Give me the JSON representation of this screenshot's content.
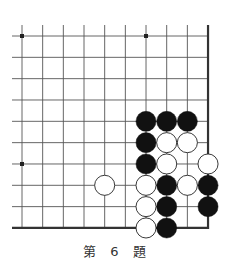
{
  "diagram": {
    "type": "go-problem",
    "caption": "第 6 題",
    "grid": {
      "columns": 10,
      "rows": 10,
      "origin_x": 22,
      "origin_y": 36,
      "step_x": 20.67,
      "step_y": 21.33,
      "open_left": true,
      "open_top": true,
      "closed_right": true,
      "closed_bottom": true
    },
    "star_points": [
      {
        "col": 0,
        "row": 0
      },
      {
        "col": 6,
        "row": 0
      },
      {
        "col": 0,
        "row": 6
      }
    ],
    "stones": [
      {
        "color": "black",
        "col": 6,
        "row": 4
      },
      {
        "color": "black",
        "col": 7,
        "row": 4
      },
      {
        "color": "black",
        "col": 8,
        "row": 4
      },
      {
        "color": "black",
        "col": 6,
        "row": 5
      },
      {
        "color": "white",
        "col": 7,
        "row": 5
      },
      {
        "color": "white",
        "col": 8,
        "row": 5
      },
      {
        "color": "black",
        "col": 6,
        "row": 6
      },
      {
        "color": "white",
        "col": 7,
        "row": 6
      },
      {
        "color": "white",
        "col": 9,
        "row": 6
      },
      {
        "color": "white",
        "col": 4,
        "row": 7
      },
      {
        "color": "white",
        "col": 6,
        "row": 7
      },
      {
        "color": "black",
        "col": 7,
        "row": 7
      },
      {
        "color": "white",
        "col": 8,
        "row": 7
      },
      {
        "color": "black",
        "col": 9,
        "row": 7
      },
      {
        "color": "white",
        "col": 6,
        "row": 8
      },
      {
        "color": "black",
        "col": 7,
        "row": 8
      },
      {
        "color": "black",
        "col": 9,
        "row": 8
      },
      {
        "color": "white",
        "col": 6,
        "row": 9
      },
      {
        "color": "black",
        "col": 7,
        "row": 9
      }
    ],
    "colors": {
      "line": "#555555",
      "edge": "#333333",
      "black_stone": "#111111",
      "white_stone": "#ffffff",
      "white_stone_outline": "#222222"
    }
  }
}
